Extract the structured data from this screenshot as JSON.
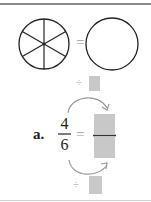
{
  "problem": {
    "label": "a.",
    "fraction": {
      "numerator": "4",
      "denominator": "6"
    },
    "equals_symbol": "=",
    "operator_top": "÷",
    "operator_bottom": "÷"
  },
  "figure": {
    "left_circle_parts": 6,
    "right_circle_parts": 0,
    "equals_symbol": "="
  },
  "colors": {
    "stroke": "#222222",
    "answer_box": "#c8c8c8",
    "arrow": "#9a9a9a",
    "rule": "#8a8a8a"
  }
}
